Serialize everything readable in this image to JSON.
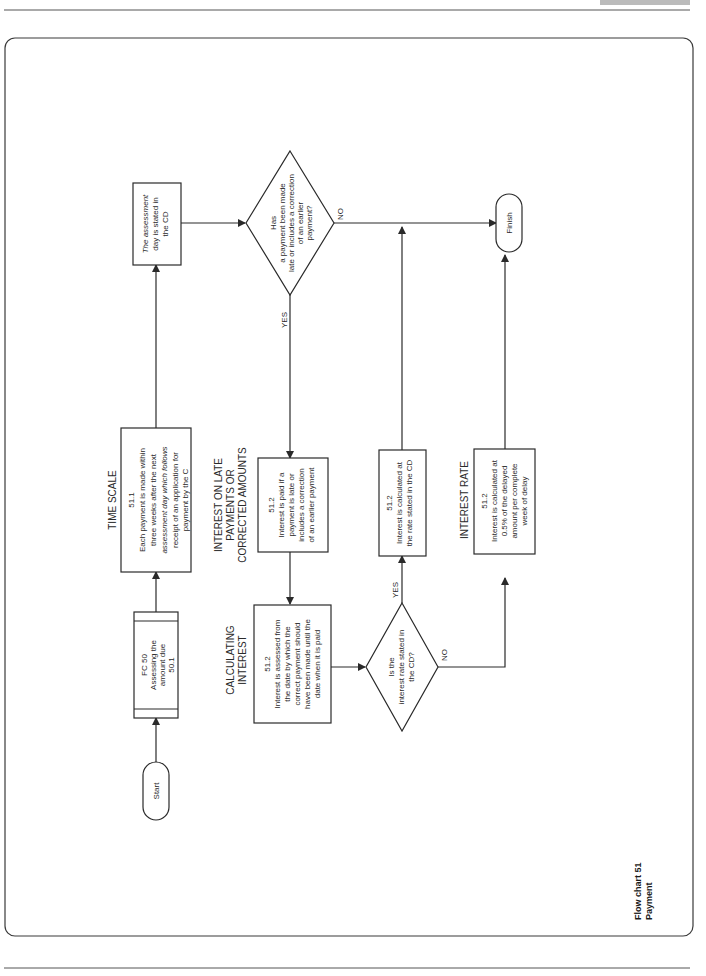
{
  "page": {
    "caption": [
      "Flow chart 51",
      "Payment"
    ]
  },
  "nodes": {
    "start": {
      "label": "Start"
    },
    "fc50": {
      "lines": [
        "FC 50",
        "Assessing the",
        "amount due",
        "50.1"
      ]
    },
    "time_scale": {
      "heading": "TIME SCALE",
      "lines": [
        "51.1",
        "Each payment is made within",
        "three weeks after the next",
        "assessment day which follows",
        "receipt of an application for",
        "payment by the C"
      ]
    },
    "assessment_day": {
      "lines": [
        "The assessment",
        "day is stated in",
        "the CD"
      ]
    },
    "decision_late": {
      "lines": [
        "Has",
        "a payment been made",
        "late or includes a correction",
        "of an earlier",
        "payment?"
      ],
      "yes_label": "YES",
      "no_label": "NO"
    },
    "finish": {
      "label": "Finish"
    },
    "interest_late": {
      "heading": [
        "INTEREST ON LATE",
        "PAYMENTS OR",
        "CORRECTED AMOUNTS"
      ],
      "lines": [
        "51.2",
        "Interest is paid if a",
        "payment is late or",
        "includes a correction",
        "of an earlier payment"
      ]
    },
    "calculating": {
      "heading": [
        "CALCULATING",
        "INTEREST"
      ],
      "lines": [
        "51.2",
        "Interest is assessed from",
        "the date by which the",
        "correct payment should",
        "have been made until the",
        "date when it is paid"
      ]
    },
    "decision_rate": {
      "lines": [
        "Is the",
        "interest rate stated in",
        "the CD?"
      ],
      "yes_label": "YES",
      "no_label": "NO"
    },
    "rate_cd": {
      "lines": [
        "51.2",
        "Interest is calculated at",
        "the rate stated in the CD"
      ]
    },
    "interest_rate": {
      "heading": "INTEREST RATE",
      "lines": [
        "51.2",
        "Interest is calculated at",
        "0.5% of the delayed",
        "amount per complete",
        "week of delay"
      ]
    }
  }
}
